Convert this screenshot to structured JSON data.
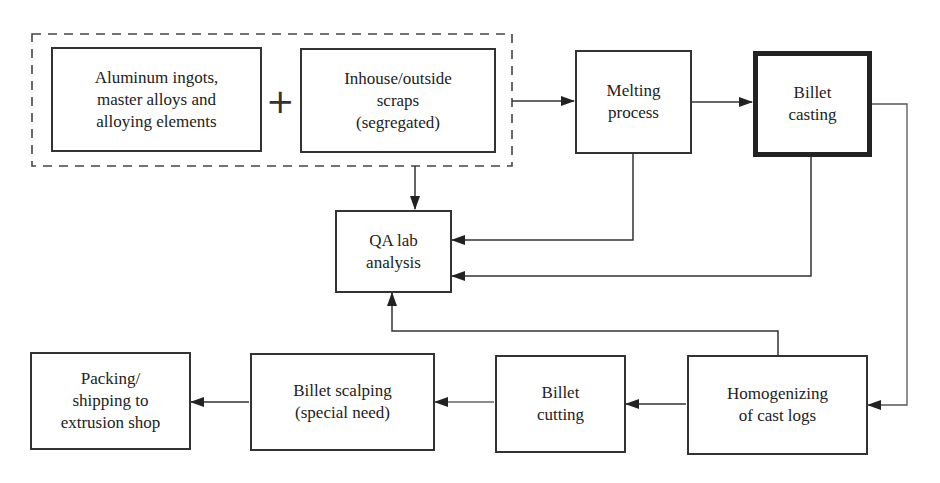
{
  "diagram": {
    "type": "process-flowchart",
    "group": {
      "label": "raw-material-inputs",
      "style": "dashed"
    },
    "operator": "+",
    "nodes": [
      {
        "id": "raw_materials",
        "label": "Aluminum ingots,\nmaster alloys and\nalloying elements"
      },
      {
        "id": "scraps",
        "label": "Inhouse/outside\nscraps\n(segregated)"
      },
      {
        "id": "melting",
        "label": "Melting\nprocess"
      },
      {
        "id": "casting",
        "label": "Billet\ncasting",
        "emphasis": "thick-border"
      },
      {
        "id": "qa",
        "label": "QA lab\nanalysis"
      },
      {
        "id": "homogenizing",
        "label": "Homogenizing\nof cast logs"
      },
      {
        "id": "cutting",
        "label": "Billet\ncutting"
      },
      {
        "id": "scalping",
        "label": "Billet scalping\n(special need)"
      },
      {
        "id": "packing",
        "label": "Packing/\nshipping to\nextrusion shop"
      }
    ],
    "edges": [
      {
        "from": "raw-material-group",
        "to": "melting"
      },
      {
        "from": "raw-material-group",
        "to": "qa"
      },
      {
        "from": "melting",
        "to": "casting"
      },
      {
        "from": "melting",
        "to": "qa"
      },
      {
        "from": "casting",
        "to": "qa"
      },
      {
        "from": "casting",
        "to": "homogenizing"
      },
      {
        "from": "homogenizing",
        "to": "qa"
      },
      {
        "from": "homogenizing",
        "to": "cutting"
      },
      {
        "from": "cutting",
        "to": "scalping"
      },
      {
        "from": "scalping",
        "to": "packing"
      }
    ],
    "colors": {
      "line": "#333333",
      "background": "#ffffff"
    }
  }
}
